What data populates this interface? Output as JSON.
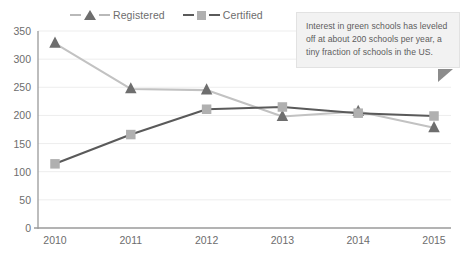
{
  "chart_data": {
    "type": "line",
    "title": "",
    "xlabel": "",
    "ylabel": "",
    "categories": [
      "2010",
      "2011",
      "2012",
      "2013",
      "2014",
      "2015"
    ],
    "x": [
      2010,
      2011,
      2012,
      2013,
      2014,
      2015
    ],
    "series": [
      {
        "name": "Registered",
        "values": [
          328,
          247,
          245,
          198,
          207,
          178
        ],
        "marker": "triangle",
        "marker_color": "#6e6e6e",
        "line_color": "#c2c2c2"
      },
      {
        "name": "Certified",
        "values": [
          114,
          166,
          211,
          215,
          204,
          199
        ],
        "marker": "square",
        "marker_color": "#b0b0b0",
        "line_color": "#5a5a5a"
      }
    ],
    "ylim": [
      0,
      350
    ],
    "yticks": [
      0,
      50,
      100,
      150,
      200,
      250,
      300,
      350
    ],
    "ytick_labels": [
      "0",
      "50",
      "100",
      "150",
      "200",
      "250",
      "300",
      "350"
    ],
    "xtick_labels": [
      "2010",
      "2011",
      "2012",
      "2013",
      "2014",
      "2015"
    ],
    "grid": true,
    "grid_axis": "y",
    "grid_color": "#ededed",
    "legend_position": "top-center",
    "axis_color": "#9a9a9a",
    "text_color": "#6d6d6d",
    "background": "#ffffff"
  },
  "legend": {
    "items": [
      {
        "label": "Registered"
      },
      {
        "label": "Certified"
      }
    ]
  },
  "callout": {
    "text": "Interest in green schools has leveled off at about 200 schools per year, a tiny fraction of schools in the US.",
    "background": "#f2f2f2",
    "tail_color": "#8c8c8c"
  }
}
